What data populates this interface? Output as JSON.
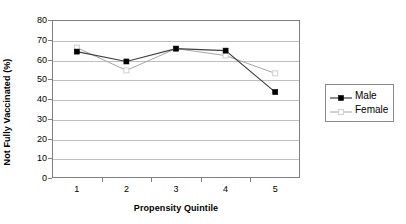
{
  "chart_data": {
    "type": "line",
    "title": "",
    "xlabel": "Propensity Quintile",
    "ylabel": "Not Fully Vaccinated (%)",
    "categories": [
      "1",
      "2",
      "3",
      "4",
      "5"
    ],
    "ylim": [
      0,
      80
    ],
    "yticks": [
      "0",
      "10",
      "20",
      "30",
      "40",
      "50",
      "60",
      "70",
      "80"
    ],
    "ytick_values": [
      0,
      10,
      20,
      30,
      40,
      50,
      60,
      70,
      80
    ],
    "grid": "horizontal",
    "legend_position": "right",
    "series": [
      {
        "name": "Male",
        "values": [
          64,
          59,
          65.5,
          64.5,
          43.5
        ],
        "color": "#3f3f3f",
        "marker": "filled-square",
        "marker_color": "#000000"
      },
      {
        "name": "Female",
        "values": [
          66,
          54.5,
          65.5,
          62,
          53
        ],
        "color": "#a6a6a6",
        "marker": "hollow-square",
        "marker_color": "#d0d0d0"
      }
    ]
  },
  "axes": {
    "y_title": "Not Fully Vaccinated (%)",
    "x_title": "Propensity Quintile"
  },
  "legend": {
    "entries": [
      {
        "label": "Male"
      },
      {
        "label": "Female"
      }
    ]
  },
  "colors": {
    "plot_border": "#808080",
    "gridline": "#bfbfbf",
    "male_line": "#3f3f3f",
    "female_line": "#a6a6a6",
    "text": "#000000",
    "background": "#ffffff"
  }
}
